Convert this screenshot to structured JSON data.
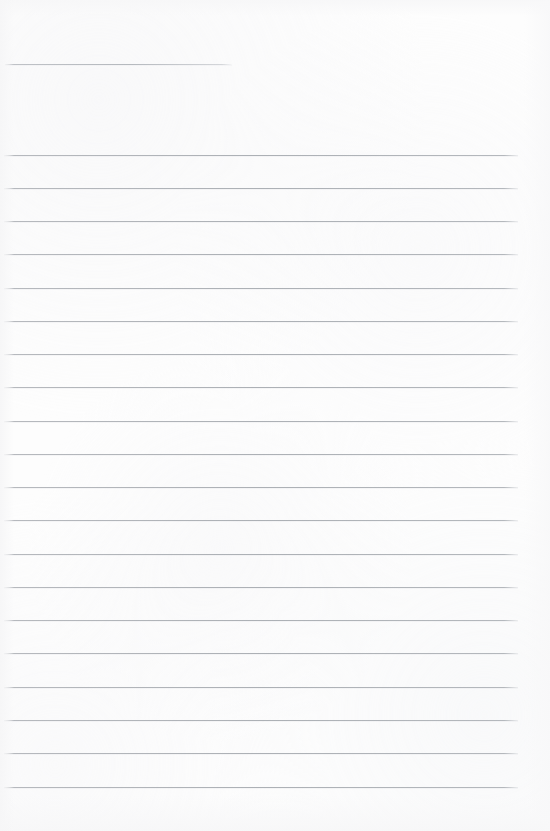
{
  "document": {
    "kind": "scanned-ruled-notebook-page",
    "title": "Blank ruled page",
    "page_width": 550,
    "page_height": 831,
    "paper_color": "#fdfdfd",
    "rule_color": "#b0b4b9",
    "text_content": "",
    "notes": "No handwriting, printed text, headings, page numbers or marks are visible anywhere on the sheet."
  },
  "header_rule": {
    "label": "header-rule",
    "x_start": 5,
    "x_end": 232,
    "y": 64,
    "thickness": 1,
    "color": "#b5b9be"
  },
  "body_rules": {
    "label": "body-ruled-lines",
    "count": 20,
    "x_start": 4,
    "x_end": 518,
    "first_y": 155,
    "spacing": 33.3,
    "thickness": 1,
    "color": "#acb0b5",
    "lines": [
      {
        "index": 1,
        "y": 155
      },
      {
        "index": 2,
        "y": 188
      },
      {
        "index": 3,
        "y": 221
      },
      {
        "index": 4,
        "y": 254
      },
      {
        "index": 5,
        "y": 288
      },
      {
        "index": 6,
        "y": 321
      },
      {
        "index": 7,
        "y": 354
      },
      {
        "index": 8,
        "y": 387
      },
      {
        "index": 9,
        "y": 421
      },
      {
        "index": 10,
        "y": 454
      },
      {
        "index": 11,
        "y": 487
      },
      {
        "index": 12,
        "y": 520
      },
      {
        "index": 13,
        "y": 554
      },
      {
        "index": 14,
        "y": 587
      },
      {
        "index": 15,
        "y": 620
      },
      {
        "index": 16,
        "y": 653
      },
      {
        "index": 17,
        "y": 687
      },
      {
        "index": 18,
        "y": 720
      },
      {
        "index": 19,
        "y": 753
      },
      {
        "index": 20,
        "y": 787
      }
    ]
  },
  "margins": {
    "top_blank_height": 64,
    "gap_after_header_rule": 91,
    "bottom_blank_height": 44,
    "left_blank_width": 4,
    "right_blank_width": 32
  }
}
